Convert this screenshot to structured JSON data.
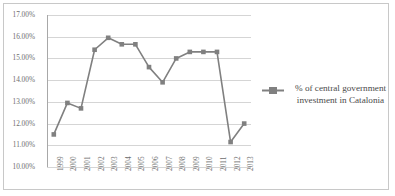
{
  "chart_data": {
    "type": "line",
    "title": "",
    "xlabel": "",
    "ylabel": "",
    "grid": true,
    "legend_position": "right",
    "ylim": [
      10.0,
      17.0
    ],
    "ytick_values": [
      17.0,
      16.0,
      15.0,
      14.0,
      13.0,
      12.0,
      11.0,
      10.0
    ],
    "ytick_labels": [
      "17.00%",
      "16.00%",
      "15.00%",
      "14.00%",
      "13.00%",
      "12.00%",
      "11.00%",
      "10.00%"
    ],
    "categories": [
      "1999",
      "2000",
      "2001",
      "2002",
      "2003",
      "2004",
      "2005",
      "2006",
      "2007",
      "2008",
      "2009",
      "2010",
      "2011",
      "2012",
      "2013"
    ],
    "series": [
      {
        "name": "% of central government investment in Catalonia",
        "color": "#808080",
        "marker": "square",
        "values": [
          11.5,
          12.95,
          12.7,
          15.4,
          15.95,
          15.65,
          15.65,
          14.6,
          13.9,
          15.0,
          15.3,
          15.3,
          15.3,
          11.15,
          12.0
        ]
      }
    ]
  },
  "legend": {
    "entries": [
      {
        "label": "% of central government investment in Catalonia",
        "color": "#808080"
      }
    ]
  },
  "colors": {
    "series": "#808080",
    "grid": "#d5d5d5",
    "axis": "#a8a8a8",
    "border": "#c8c8c8",
    "text": "#6e6e6e",
    "legend_text": "#4a4a4a",
    "background": "#ffffff"
  }
}
